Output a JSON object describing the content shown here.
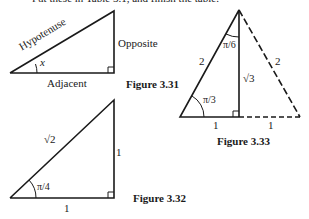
{
  "intro_text": "Put these in Table 3.1, and finish the table.",
  "figures": {
    "fig331": {
      "caption": "Figure 3.31",
      "hypotenuse": "Hypotenuse",
      "opposite": "Opposite",
      "adjacent": "Adjacent",
      "angle": "x"
    },
    "fig332": {
      "caption": "Figure 3.32",
      "hypotenuse": "√2",
      "opposite": "1",
      "adjacent": "1",
      "angle": "π/4"
    },
    "fig333": {
      "caption": "Figure 3.33",
      "left_side": "2",
      "right_side": "2",
      "height": "√3",
      "top_angle": "π/6",
      "base_angle": "π/3",
      "left_base": "1",
      "right_base": "1"
    }
  }
}
